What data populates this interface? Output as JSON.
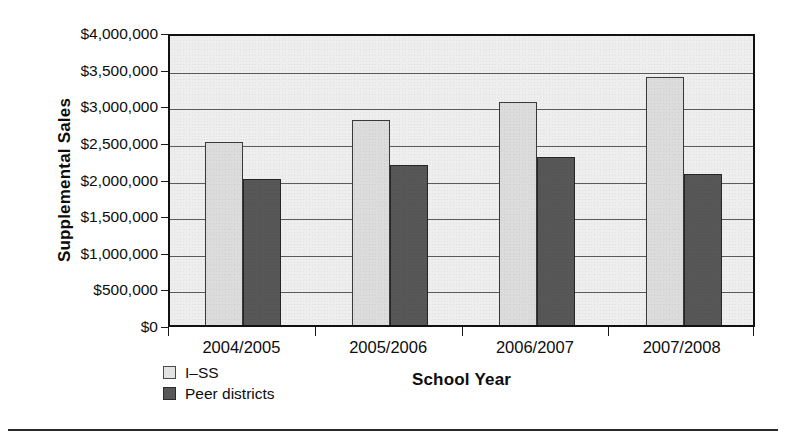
{
  "chart_data": {
    "type": "bar",
    "title": "",
    "xlabel": "School Year",
    "ylabel": "Supplemental Sales",
    "categories": [
      "2004/2005",
      "2005/2006",
      "2006/2007",
      "2007/2008"
    ],
    "series": [
      {
        "name": "I–SS",
        "color": "#dcdcdc",
        "values": [
          2553000,
          2853000,
          3100000,
          3440000
        ]
      },
      {
        "name": "Peer districts",
        "color": "#575757",
        "values": [
          2048000,
          2239000,
          2348000,
          2116000
        ]
      }
    ],
    "ylim": [
      0,
      4000000
    ],
    "ytick_values": [
      4000000,
      3500000,
      3000000,
      2500000,
      2000000,
      1500000,
      1000000,
      500000,
      0
    ],
    "ytick_labels": [
      "$4,000,000",
      "$3,500,000",
      "$3,000,000",
      "$2,500,000",
      "$2,000,000",
      "$1,500,000",
      "$1,000,000",
      "$500,000",
      "$0"
    ],
    "grid": "horizontal",
    "legend_position": "below-left",
    "plot_background": "#eeeeee"
  },
  "legend": {
    "items": [
      {
        "label": "I–SS",
        "swatch": "light"
      },
      {
        "label": "Peer districts",
        "swatch": "dark"
      }
    ]
  }
}
